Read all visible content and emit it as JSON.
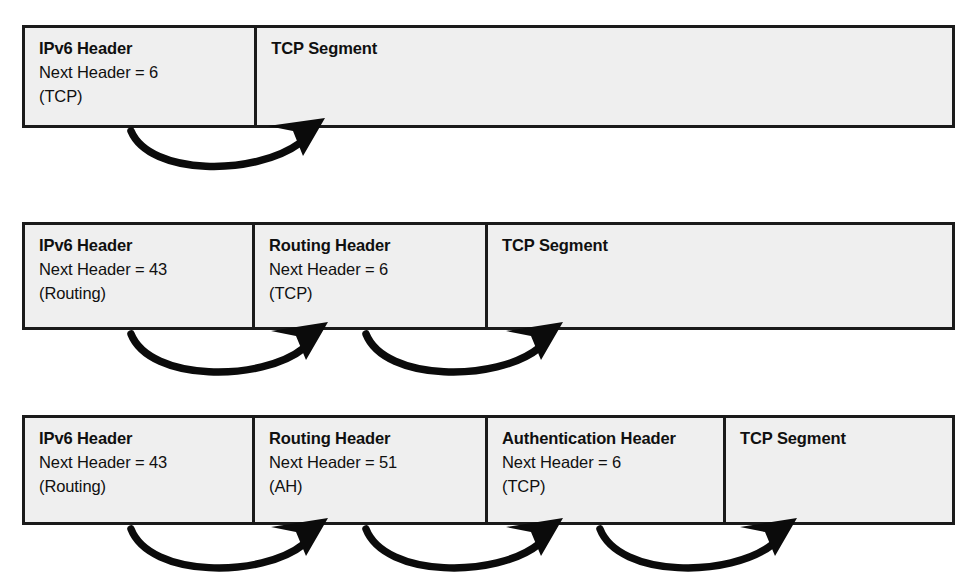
{
  "diagram": {
    "caption": "",
    "colors": {
      "box_fill": "#efefef",
      "box_border": "#1a1a1a",
      "arrow": "#0b0b0b",
      "text": "#101010",
      "page_background": "#ffffff"
    },
    "rows": [
      {
        "id": "row-no-extension-headers",
        "cells": [
          {
            "id": "ipv6-header",
            "title": "IPv6 Header",
            "line2": "Next Header = 6",
            "line3": "(TCP)",
            "width_px": 233
          },
          {
            "id": "tcp-segment",
            "title": "TCP Segment",
            "line2": "",
            "line3": "",
            "width_px": 700
          }
        ],
        "arrows": [
          {
            "from_cell": "ipv6-header",
            "to_cell": "tcp-segment",
            "label": "next-header-6-to-tcp"
          }
        ]
      },
      {
        "id": "row-one-extension-header",
        "cells": [
          {
            "id": "ipv6-header",
            "title": "IPv6 Header",
            "line2": "Next Header = 43",
            "line3": "(Routing)",
            "width_px": 230
          },
          {
            "id": "routing-header",
            "title": "Routing Header",
            "line2": "Next Header = 6",
            "line3": "(TCP)",
            "width_px": 233
          },
          {
            "id": "tcp-segment",
            "title": "TCP Segment",
            "line2": "",
            "line3": "",
            "width_px": 470
          }
        ],
        "arrows": [
          {
            "from_cell": "ipv6-header",
            "to_cell": "routing-header",
            "label": "next-header-43-to-routing"
          },
          {
            "from_cell": "routing-header",
            "to_cell": "tcp-segment",
            "label": "next-header-6-to-tcp"
          }
        ]
      },
      {
        "id": "row-two-extension-headers",
        "cells": [
          {
            "id": "ipv6-header",
            "title": "IPv6 Header",
            "line2": "Next Header = 43",
            "line3": "(Routing)",
            "width_px": 230
          },
          {
            "id": "routing-header",
            "title": "Routing Header",
            "line2": "Next Header = 51",
            "line3": "(AH)",
            "width_px": 233
          },
          {
            "id": "authentication-header",
            "title": "Authentication Header",
            "line2": "Next Header = 6",
            "line3": "(TCP)",
            "width_px": 238
          },
          {
            "id": "tcp-segment",
            "title": "TCP Segment",
            "line2": "",
            "line3": "",
            "width_px": 232
          }
        ],
        "arrows": [
          {
            "from_cell": "ipv6-header",
            "to_cell": "routing-header",
            "label": "next-header-43-to-routing"
          },
          {
            "from_cell": "routing-header",
            "to_cell": "authentication-header",
            "label": "next-header-51-to-ah"
          },
          {
            "from_cell": "authentication-header",
            "to_cell": "tcp-segment",
            "label": "next-header-6-to-tcp"
          }
        ]
      }
    ]
  }
}
